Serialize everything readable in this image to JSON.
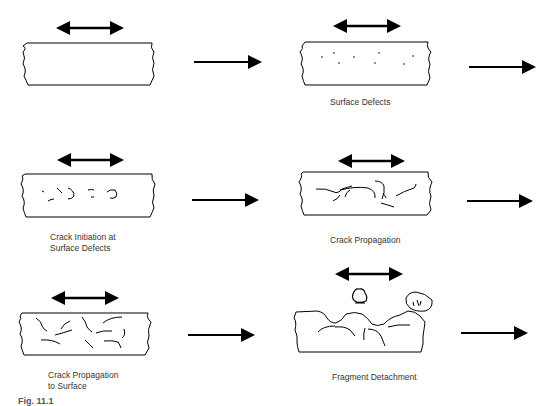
{
  "figure": {
    "label": "Fig. 11.1",
    "stages": [
      {
        "id": "stage-1",
        "caption": ""
      },
      {
        "id": "stage-2",
        "caption": "Surface Defects"
      },
      {
        "id": "stage-3",
        "caption_line1": "Crack Initiation at",
        "caption_line2": "Surface Defects"
      },
      {
        "id": "stage-4",
        "caption": "Crack Propagation"
      },
      {
        "id": "stage-5",
        "caption_line1": "Crack Propagation",
        "caption_line2": "to Surface"
      },
      {
        "id": "stage-6",
        "caption": "Fragment Detachment"
      }
    ],
    "icons": {
      "load": "double-headed-arrow-icon",
      "progression": "right-arrow-icon"
    },
    "colors": {
      "stroke": "#000000",
      "caption": "#333333",
      "background": "#ffffff"
    }
  }
}
